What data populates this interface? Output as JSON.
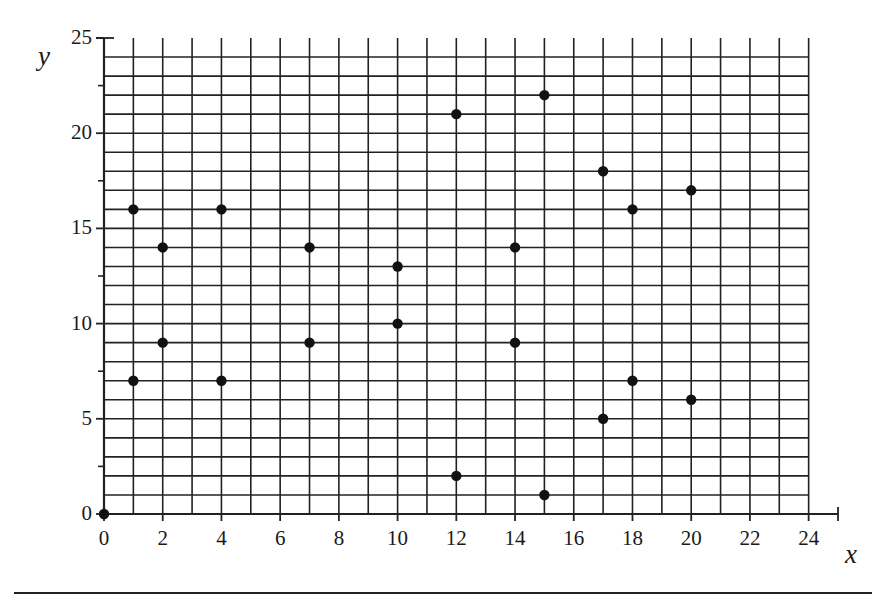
{
  "figure": {
    "kind": "scatter-plot",
    "background": "#ffffff",
    "ink_color": "#222222",
    "point_color": "#111111"
  },
  "axes": {
    "x_letter": "x",
    "y_letter": "y",
    "x_tick_labels": [
      "0",
      "2",
      "4",
      "6",
      "8",
      "10",
      "12",
      "14",
      "16",
      "18",
      "20",
      "22",
      "24"
    ],
    "y_tick_labels": [
      "0",
      "5",
      "10",
      "15",
      "20",
      "25"
    ]
  },
  "chart_data": {
    "type": "scatter",
    "title": "",
    "xlabel": "x",
    "ylabel": "y",
    "xlim": [
      0,
      25
    ],
    "ylim": [
      0,
      25
    ],
    "xticks": [
      0,
      2,
      4,
      6,
      8,
      10,
      12,
      14,
      16,
      18,
      20,
      22,
      24
    ],
    "yticks": [
      0,
      5,
      10,
      15,
      20,
      25
    ],
    "x_minor_step": 1,
    "y_minor_step": 1,
    "grid": true,
    "grid_x_range": [
      0,
      24
    ],
    "grid_y_range": [
      0,
      24
    ],
    "legend": "none",
    "marker": "filled-circle",
    "points": [
      {
        "x": 0,
        "y": 0
      },
      {
        "x": 1,
        "y": 16
      },
      {
        "x": 1,
        "y": 7
      },
      {
        "x": 2,
        "y": 14
      },
      {
        "x": 2,
        "y": 9
      },
      {
        "x": 4,
        "y": 16
      },
      {
        "x": 4,
        "y": 7
      },
      {
        "x": 7,
        "y": 14
      },
      {
        "x": 7,
        "y": 9
      },
      {
        "x": 10,
        "y": 13
      },
      {
        "x": 10,
        "y": 10
      },
      {
        "x": 12,
        "y": 21
      },
      {
        "x": 12,
        "y": 2
      },
      {
        "x": 14,
        "y": 14
      },
      {
        "x": 14,
        "y": 9
      },
      {
        "x": 15,
        "y": 22
      },
      {
        "x": 15,
        "y": 1
      },
      {
        "x": 17,
        "y": 18
      },
      {
        "x": 17,
        "y": 5
      },
      {
        "x": 18,
        "y": 16
      },
      {
        "x": 18,
        "y": 7
      },
      {
        "x": 20,
        "y": 17
      },
      {
        "x": 20,
        "y": 6
      }
    ]
  }
}
